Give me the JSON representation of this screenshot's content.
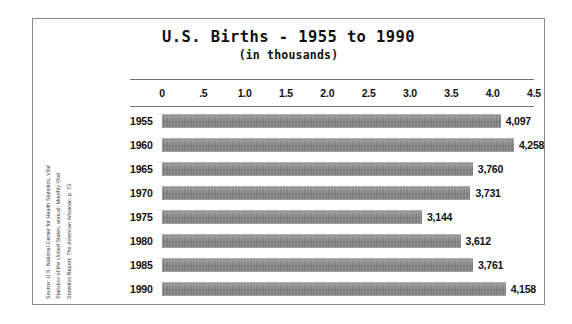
{
  "chart_data": {
    "type": "bar",
    "orientation": "horizontal",
    "title": "U.S. Births - 1955 to 1990",
    "subtitle": "(in thousands)",
    "xlabel": "",
    "ylabel": "",
    "xlim": [
      0,
      4.5
    ],
    "grid": false,
    "legend": null,
    "units": "thousands",
    "value_scale_divisor": 1000,
    "tick_labels": [
      "0",
      ".5",
      "1.0",
      "1.5",
      "2.0",
      "2.5",
      "3.0",
      "3.5",
      "4.0",
      "4.5"
    ],
    "tick_values": [
      0,
      0.5,
      1.0,
      1.5,
      2.0,
      2.5,
      3.0,
      3.5,
      4.0,
      4.5
    ],
    "categories": [
      "1955",
      "1960",
      "1965",
      "1970",
      "1975",
      "1980",
      "1985",
      "1990"
    ],
    "values": [
      4.097,
      4.258,
      3.76,
      3.731,
      3.144,
      3.612,
      3.761,
      4.158
    ],
    "value_labels": [
      "4,097",
      "4,258",
      "3,760",
      "3,731",
      "3,144",
      "3,612",
      "3,761",
      "4,158"
    ],
    "bar_color": "#8c8c8c",
    "annotations": [
      "Source: U.S. National Center for Health Statistics, Vital Statistics of the United States, annual; Monthly Vital Statistics Report; The American Almanac; p. 73."
    ]
  },
  "source_note": {
    "line1_plain": "Source: U.S. National Center for Health Statistics, ",
    "line1_italic": "Vital",
    "line2_italic": "Statistics of the United States",
    "line2_plain": ", annual; Monthly Vital",
    "line3_plain": "Statistics Report; ",
    "line3_italic": "The American Almanac",
    "line3_tail": "; p. 73."
  }
}
